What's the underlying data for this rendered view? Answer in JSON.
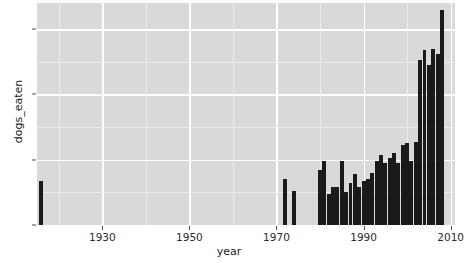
{
  "chart_data": {
    "type": "bar",
    "title": "",
    "subtitle": "",
    "xlabel": "year",
    "ylabel": "dogs_eaten",
    "xlim": [
      1915,
      2011
    ],
    "ylim": [
      0,
      68
    ],
    "grid": true,
    "legend": false,
    "legend_position": "none",
    "x_ticks": [
      1930,
      1950,
      1970,
      1990,
      2010
    ],
    "x_tick_labels": [
      "1930",
      "1950",
      "1970",
      "1990",
      "2010"
    ],
    "y_ticks": [
      0,
      20,
      40,
      60
    ],
    "y_tick_labels": [
      "0",
      "20",
      "40",
      "60"
    ],
    "y_minor_ticks": [
      10,
      30,
      50
    ],
    "x_minor_ticks": [
      1920,
      1940,
      1960,
      1980,
      2000
    ],
    "bar_color": "#1a1a1a",
    "panel_color": "#d9d9d9",
    "grid_color": "#ffffff",
    "bar_width_years": 0.9,
    "x": [
      1916,
      1972,
      1974,
      1980,
      1981,
      1982,
      1983,
      1984,
      1985,
      1986,
      1987,
      1988,
      1989,
      1990,
      1991,
      1992,
      1993,
      1994,
      1995,
      1996,
      1997,
      1998,
      1999,
      2000,
      2001,
      2002,
      2003,
      2004,
      2005,
      2006,
      2007,
      2008
    ],
    "values": [
      13.5,
      14,
      10.5,
      17,
      19.5,
      9.5,
      11.5,
      11.5,
      19.5,
      10,
      13,
      15.5,
      11.5,
      13.5,
      14,
      16,
      19.5,
      21.5,
      19,
      20.5,
      22,
      19,
      24.5,
      25,
      19.5,
      25.5,
      50.5,
      53.5,
      49,
      54,
      52.5,
      66
    ],
    "series": [
      {
        "name": "dogs_eaten",
        "values": [
          13.5,
          14,
          10.5,
          17,
          19.5,
          9.5,
          11.5,
          11.5,
          19.5,
          10,
          13,
          15.5,
          11.5,
          13.5,
          14,
          16,
          19.5,
          21.5,
          19,
          20.5,
          22,
          19,
          24.5,
          25,
          19.5,
          25.5,
          50.5,
          53.5,
          49,
          54,
          52.5,
          66
        ]
      }
    ],
    "annotations": []
  },
  "axes": {
    "y_title": "dogs_eaten",
    "x_title": "year"
  }
}
